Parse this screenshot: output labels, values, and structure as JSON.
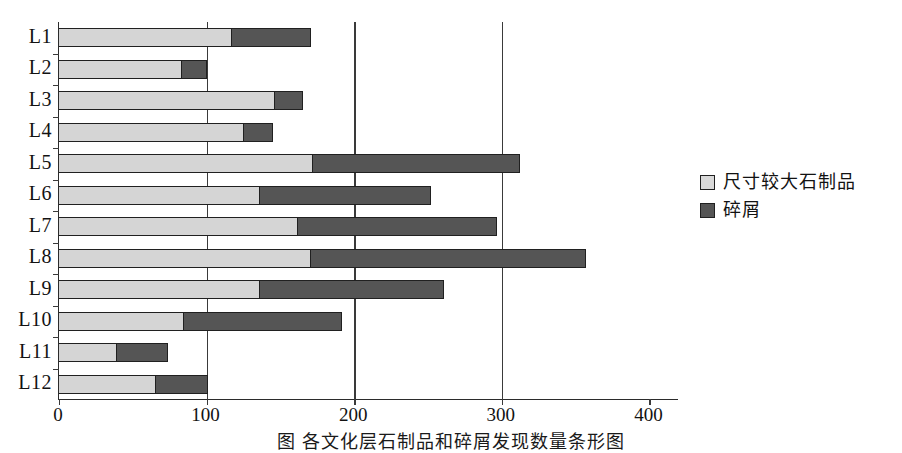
{
  "chart_data": {
    "type": "bar",
    "orientation": "horizontal",
    "stacked": true,
    "title": "",
    "xlabel": "",
    "ylabel": "",
    "categories": [
      "L1",
      "L2",
      "L3",
      "L4",
      "L5",
      "L6",
      "L7",
      "L8",
      "L9",
      "L10",
      "L11",
      "L12"
    ],
    "series": [
      {
        "name": "尺寸较大石制品",
        "color": "#d5d5d5",
        "values": [
          117,
          83,
          146,
          125,
          172,
          136,
          162,
          171,
          136,
          85,
          39,
          66
        ]
      },
      {
        "name": "碎屑",
        "color": "#555555",
        "values": [
          54,
          17,
          19,
          20,
          140,
          116,
          135,
          186,
          125,
          107,
          35,
          35
        ]
      }
    ],
    "totals": [
      171,
      100,
      165,
      145,
      312,
      252,
      297,
      357,
      261,
      192,
      74,
      101
    ],
    "xlim": [
      0,
      420
    ],
    "xticks": [
      0,
      100,
      200,
      300,
      400
    ],
    "xtick_labels": [
      "0",
      "100",
      "200",
      "300",
      "400"
    ],
    "gridlines_x": [
      100,
      200,
      300
    ],
    "grid": true,
    "legend_position": "right"
  },
  "legend": {
    "items": [
      {
        "label": "尺寸较大石制品",
        "swatch": "light"
      },
      {
        "label": "碎屑",
        "swatch": "dark"
      }
    ]
  },
  "caption": {
    "text": "图 各文化层石制品和碎屑发现数量条形图"
  }
}
